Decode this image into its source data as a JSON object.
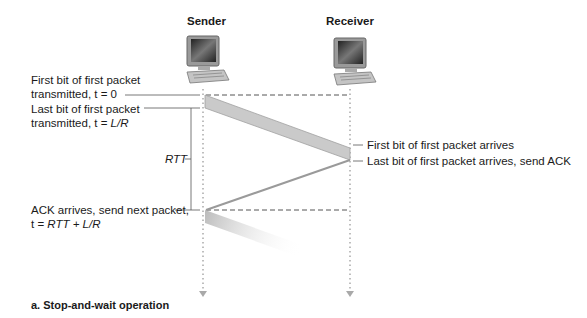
{
  "headers": {
    "sender": "Sender",
    "receiver": "Receiver"
  },
  "sender_labels": {
    "first_bit_line1": "First bit of first packet",
    "first_bit_line2": "transmitted, t = 0",
    "last_bit_line1": "Last bit of first packet",
    "last_bit_line2_prefix": "transmitted, t = ",
    "last_bit_line2_italic": "L/R",
    "rtt": "RTT",
    "ack_line1": "ACK arrives, send next packet,",
    "ack_line2_prefix": "t = ",
    "ack_line2_italic": "RTT + L/R"
  },
  "receiver_labels": {
    "first_bit_arrives": "First bit of first packet arrives",
    "last_bit_arrives": "Last bit of first packet arrives, send ACK"
  },
  "caption": "a. Stop-and-wait operation",
  "icons": {
    "sender": "computer-icon",
    "receiver": "computer-icon"
  },
  "colors": {
    "packet_band": "#c8c8c8",
    "timeline": "#a9a9a9",
    "text": "#1a1a1a"
  }
}
